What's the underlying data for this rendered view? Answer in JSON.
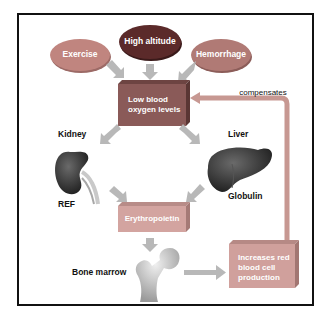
{
  "diagram": {
    "causes": [
      {
        "label": "Exercise",
        "color": "#c0857f"
      },
      {
        "label": "High altitude",
        "color": "#5b2a2a"
      },
      {
        "label": "Hemorrhage",
        "color": "#b07a75"
      }
    ],
    "central_box": {
      "label_line1": "Low blood",
      "label_line2": "oxygen levels",
      "color": "#8a5a58"
    },
    "organs": {
      "kidney": {
        "label": "Kidney",
        "sub_label": "REF"
      },
      "liver": {
        "label": "Liver",
        "sub_label": "Globulin"
      }
    },
    "hormone_box": {
      "label": "Erythropoietin",
      "color": "#d3a4a0"
    },
    "bone": {
      "label": "Bone marrow"
    },
    "result_box": {
      "label_line1": "Increases red",
      "label_line2": "blood cell",
      "label_line3": "production",
      "color": "#d0a09c"
    },
    "feedback": {
      "label": "compensates",
      "color": "#c79892"
    },
    "arrow_color": "#b8b8b8"
  }
}
